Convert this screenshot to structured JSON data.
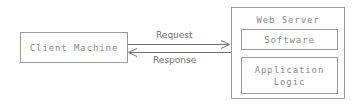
{
  "diagram": {
    "background_color": "#ffffff",
    "border_color": "#9a9a9a",
    "mono_text_color": "#8a8a8a",
    "label_text_color": "#6f6f6f",
    "line_color": "#6f6f6f",
    "nodes": {
      "client": {
        "label": "Client Machine"
      },
      "server": {
        "title": "Web Server",
        "components": [
          {
            "label": "Software"
          },
          {
            "label": "Application\nLogic"
          }
        ]
      }
    },
    "connectors": [
      {
        "name": "request",
        "label": "Request",
        "direction": "client-to-server",
        "arrowhead": "right"
      },
      {
        "name": "response",
        "label": "Response",
        "direction": "server-to-client",
        "arrowhead": "left"
      }
    ]
  }
}
